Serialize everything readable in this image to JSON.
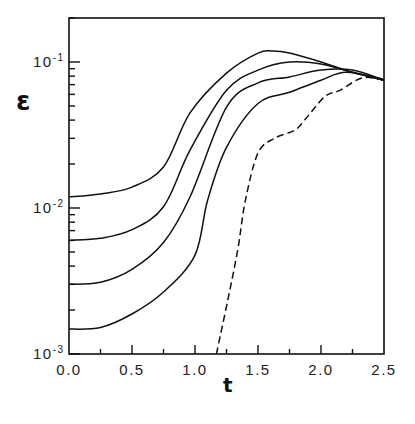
{
  "chart_data": {
    "type": "line",
    "title": "",
    "xlabel": "t",
    "ylabel": "ε",
    "xlim": [
      0,
      2.5
    ],
    "ylim": [
      0.001,
      0.2
    ],
    "yscale": "log",
    "grid": false,
    "legend": null,
    "x_ticks": [
      {
        "value": 0.0,
        "label": "0.0"
      },
      {
        "value": 0.5,
        "label": "0.5"
      },
      {
        "value": 1.0,
        "label": "1.0"
      },
      {
        "value": 1.5,
        "label": "1.5"
      },
      {
        "value": 2.0,
        "label": "2.0"
      },
      {
        "value": 2.5,
        "label": "2.5"
      }
    ],
    "y_ticks": [
      {
        "value": 0.1,
        "base": "10",
        "exp": "-1"
      },
      {
        "value": 0.01,
        "base": "10",
        "exp": "-2"
      },
      {
        "value": 0.001,
        "base": "10",
        "exp": "-3"
      }
    ],
    "series": [
      {
        "name": "curve-1",
        "style": "solid",
        "x": [
          0,
          0.25,
          0.5,
          0.75,
          0.96,
          1.25,
          1.5,
          1.62,
          1.75,
          2.0,
          2.25,
          2.5
        ],
        "y": [
          0.0119,
          0.0125,
          0.0139,
          0.0191,
          0.0448,
          0.084,
          0.115,
          0.119,
          0.115,
          0.1,
          0.085,
          0.075
        ]
      },
      {
        "name": "curve-2",
        "style": "solid",
        "x": [
          0,
          0.25,
          0.5,
          0.75,
          0.96,
          1.25,
          1.5,
          1.75,
          2.0,
          2.25,
          2.5
        ],
        "y": [
          0.006,
          0.0062,
          0.0071,
          0.0102,
          0.0249,
          0.064,
          0.088,
          0.1,
          0.097,
          0.085,
          0.076
        ]
      },
      {
        "name": "curve-3",
        "style": "solid",
        "x": [
          0,
          0.25,
          0.5,
          0.75,
          0.96,
          1.25,
          1.5,
          1.75,
          2.0,
          2.25,
          2.5
        ],
        "y": [
          0.003,
          0.0031,
          0.0038,
          0.0058,
          0.0119,
          0.049,
          0.072,
          0.079,
          0.088,
          0.088,
          0.075
        ]
      },
      {
        "name": "curve-4",
        "style": "solid",
        "x": [
          0,
          0.25,
          0.5,
          0.75,
          1.0,
          1.1,
          1.25,
          1.5,
          1.75,
          2.0,
          2.2,
          2.5
        ],
        "y": [
          0.00148,
          0.00152,
          0.00188,
          0.00266,
          0.00476,
          0.0113,
          0.026,
          0.052,
          0.062,
          0.075,
          0.085,
          0.075
        ]
      },
      {
        "name": "curve-dashed",
        "style": "dashed",
        "x": [
          1.17,
          1.26,
          1.34,
          1.4,
          1.5,
          1.63,
          1.79,
          1.87,
          2.03,
          2.15,
          2.33,
          2.5
        ],
        "y": [
          0.001,
          0.00234,
          0.0052,
          0.0113,
          0.0238,
          0.03,
          0.034,
          0.04,
          0.058,
          0.064,
          0.078,
          0.075
        ]
      }
    ]
  }
}
